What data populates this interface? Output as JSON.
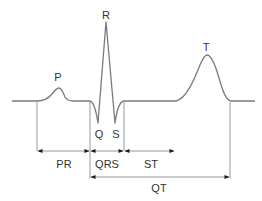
{
  "diagram": {
    "colors": {
      "trace": "#7a7a7a",
      "lines": "#9a9a9a",
      "arrows": "#1a1a1a",
      "text": "#333333",
      "background": "#ffffff"
    },
    "waves": {
      "P": "P",
      "Q": "Q",
      "R": "R",
      "S": "S",
      "T": "T"
    },
    "intervals": {
      "PR": "PR",
      "QRS": "QRS",
      "ST": "ST",
      "QT": "QT"
    }
  }
}
